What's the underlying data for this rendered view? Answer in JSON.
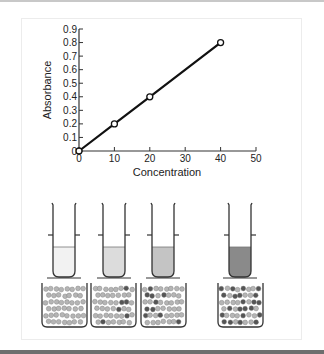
{
  "chart_data": {
    "type": "line",
    "title": "",
    "xlabel": "Concentration",
    "ylabel": "Absorbance",
    "x": [
      0,
      10,
      20,
      40
    ],
    "values": [
      0,
      0.2,
      0.4,
      0.8
    ],
    "series": [
      {
        "name": "Absorbance vs Concentration",
        "x": [
          0,
          10,
          20,
          40
        ],
        "values": [
          0,
          0.2,
          0.4,
          0.8
        ],
        "marker": "open-circle",
        "line_color": "#111111"
      }
    ],
    "xlim": [
      0,
      50
    ],
    "ylim": [
      0,
      0.9
    ],
    "x_ticks": [
      "0",
      "10",
      "20",
      "30",
      "40",
      "50"
    ],
    "y_ticks": [
      "0",
      "0.1",
      "0.2",
      "0.3",
      "0.4",
      "0.5",
      "0.6",
      "0.7",
      "0.8",
      "0.9"
    ],
    "grid": false,
    "legend": "none"
  },
  "illustration": {
    "samples": [
      {
        "label": "sample-1",
        "liquid_color": "#f2f2f2",
        "dark_particles": 0
      },
      {
        "label": "sample-2",
        "liquid_color": "#dcdcdc",
        "dark_particles": 6
      },
      {
        "label": "sample-3",
        "liquid_color": "#c4c4c4",
        "dark_particles": 12
      },
      {
        "label": "sample-4",
        "liquid_color": "#8a8a8a",
        "dark_particles": 24
      }
    ]
  },
  "colors": {
    "axis": "#333333",
    "line": "#111111",
    "particle_light": "#b5b5b5",
    "particle_dark": "#555555"
  }
}
